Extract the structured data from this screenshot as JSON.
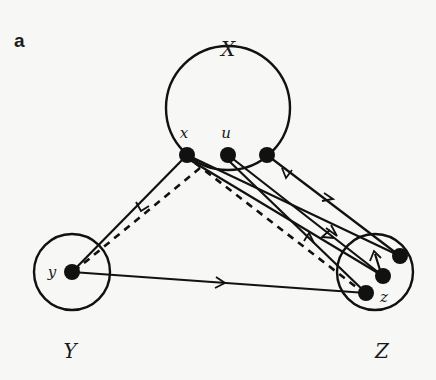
{
  "figure": {
    "panel_label": "a",
    "sets": [
      {
        "id": "X",
        "label": "X",
        "cx": 228,
        "cy": 108,
        "r": 62,
        "label_x": 228,
        "label_y": 56
      },
      {
        "id": "Y",
        "label": "Y",
        "cx": 72,
        "cy": 272,
        "r": 38,
        "label_x": 70,
        "label_y": 358
      },
      {
        "id": "Z",
        "label": "Z",
        "cx": 375,
        "cy": 272,
        "r": 38,
        "label_x": 382,
        "label_y": 358
      }
    ],
    "nodes": [
      {
        "id": "x",
        "label": "x",
        "set": "X",
        "cx": 187,
        "cy": 155,
        "label_x": 184,
        "label_y": 138
      },
      {
        "id": "u",
        "label": "u",
        "set": "X",
        "cx": 228,
        "cy": 155,
        "label_x": 226,
        "label_y": 138
      },
      {
        "id": "w",
        "label": "",
        "set": "X",
        "cx": 267,
        "cy": 155
      },
      {
        "id": "y",
        "label": "y",
        "set": "Y",
        "cx": 72,
        "cy": 272,
        "label_x": 50,
        "label_y": 277
      },
      {
        "id": "z1",
        "label": "",
        "set": "Z",
        "cx": 400,
        "cy": 256
      },
      {
        "id": "z2",
        "label": "",
        "set": "Z",
        "cx": 383,
        "cy": 276
      },
      {
        "id": "z",
        "label": "z",
        "set": "Z",
        "cx": 366,
        "cy": 293,
        "label_x": 381,
        "label_y": 302
      }
    ],
    "edges": [
      {
        "from": "x",
        "to": "y",
        "style": "solid",
        "arrow": "toward y"
      },
      {
        "from": "x",
        "to": "y",
        "style": "dashed",
        "arrow": "none"
      },
      {
        "from": "x",
        "to": "z",
        "style": "dashed",
        "arrow": "none"
      },
      {
        "from": "y",
        "to": "z",
        "style": "solid",
        "arrow": "toward z"
      },
      {
        "from": "x",
        "to": "z1",
        "style": "solid",
        "arrow": "toward z1"
      },
      {
        "from": "z2",
        "to": "x",
        "style": "solid",
        "arrow": "toward x"
      },
      {
        "from": "u",
        "to": "z2",
        "style": "solid",
        "arrow": "toward z2"
      },
      {
        "from": "z",
        "to": "u",
        "style": "solid",
        "arrow": "toward u"
      },
      {
        "from": "w",
        "to": "z1",
        "style": "solid",
        "arrow": "toward z1"
      },
      {
        "from": "z1",
        "to": "w",
        "style": "solid",
        "arrow": "toward w"
      }
    ]
  }
}
